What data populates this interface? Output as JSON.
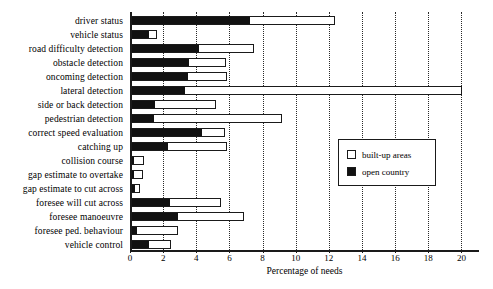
{
  "chart_data": {
    "type": "bar",
    "orientation": "horizontal",
    "stacked": true,
    "title": "",
    "xlabel": "Percentage of needs",
    "ylabel": "",
    "xlim": [
      0,
      21
    ],
    "xticks": [
      0,
      2,
      4,
      6,
      8,
      10,
      12,
      14,
      16,
      18,
      20
    ],
    "xtick_labels": [
      "0",
      "2",
      "4",
      "6",
      "8",
      "10",
      "12",
      "14",
      "16",
      "18",
      "20"
    ],
    "grid": "vertical-dotted",
    "legend_position": "center-right",
    "categories": [
      "driver status",
      "vehicle status",
      "road difficulty detection",
      "obstacle detection",
      "oncoming detection",
      "lateral detection",
      "side or back detection",
      "pedestrian detection",
      "correct speed evaluation",
      "catching up",
      "collision course",
      "gap estimate to overtake",
      "gap estimate to cut across",
      "foresee will cut across",
      "foresee manoeuvre",
      "foresee ped. behaviour",
      "vehicle control"
    ],
    "series": [
      {
        "name": "open country",
        "color": "#111111",
        "values": [
          7.1,
          1.0,
          4.05,
          3.45,
          3.4,
          3.2,
          1.4,
          1.3,
          4.25,
          2.2,
          0.15,
          0.15,
          0.2,
          2.3,
          2.75,
          0.3,
          1.0
        ]
      },
      {
        "name": "built-up areas",
        "color": "#ffffff",
        "values": [
          5.2,
          0.55,
          3.35,
          2.3,
          2.4,
          16.8,
          3.75,
          7.8,
          1.45,
          3.6,
          0.65,
          0.55,
          0.35,
          3.15,
          4.05,
          2.55,
          1.4
        ]
      }
    ],
    "totals": [
      12.3,
      1.55,
      7.4,
      5.75,
      5.8,
      20.0,
      5.15,
      9.1,
      5.7,
      5.8,
      0.8,
      0.7,
      0.55,
      5.45,
      6.8,
      2.85,
      2.4
    ]
  },
  "legend": {
    "items": [
      {
        "label": "built-up areas",
        "swatch": "#ffffff"
      },
      {
        "label": "open country",
        "swatch": "#111111"
      }
    ]
  },
  "colors": {
    "open_country": "#111111",
    "built_up_areas": "#ffffff",
    "axis": "#1a1a1a",
    "grid": "#2a2a2a",
    "background": "#ffffff"
  }
}
